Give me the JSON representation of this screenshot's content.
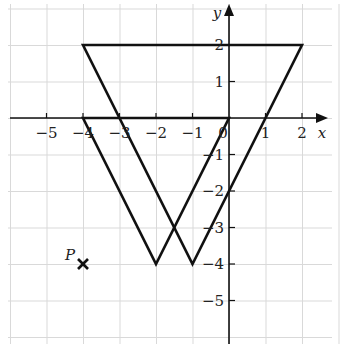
{
  "figure": {
    "type": "coordinate-grid-diagram",
    "x_axis_label": "x",
    "y_axis_label": "y",
    "x_range": [
      -6,
      3
    ],
    "y_range": [
      -6,
      3
    ],
    "x_ticks": [
      {
        "value": -5,
        "label": "−5"
      },
      {
        "value": -4,
        "label": "−4"
      },
      {
        "value": -3,
        "label": "−3"
      },
      {
        "value": -2,
        "label": "−2"
      },
      {
        "value": -1,
        "label": "−1"
      },
      {
        "value": 0,
        "label": "0"
      },
      {
        "value": 1,
        "label": "1"
      },
      {
        "value": 2,
        "label": "2"
      }
    ],
    "y_ticks": [
      {
        "value": 2,
        "label": "2"
      },
      {
        "value": 1,
        "label": "1"
      },
      {
        "value": -1,
        "label": "−1"
      },
      {
        "value": -2,
        "label": "−2"
      },
      {
        "value": -3,
        "label": "−3"
      },
      {
        "value": -4,
        "label": "−4"
      },
      {
        "value": -5,
        "label": "−5"
      }
    ],
    "shapes": [
      {
        "name": "triangle-A",
        "vertices": [
          [
            -4,
            2
          ],
          [
            2,
            2
          ],
          [
            -1,
            -4
          ]
        ]
      },
      {
        "name": "triangle-B",
        "vertices": [
          [
            -4,
            0
          ],
          [
            0,
            0
          ],
          [
            -2,
            -4
          ]
        ]
      }
    ],
    "point": {
      "label": "P",
      "x": -4,
      "y": -4,
      "marker": "cross"
    },
    "colors": {
      "line": "#111111",
      "grid": "#d9d9d9",
      "background": "#ffffff"
    }
  }
}
